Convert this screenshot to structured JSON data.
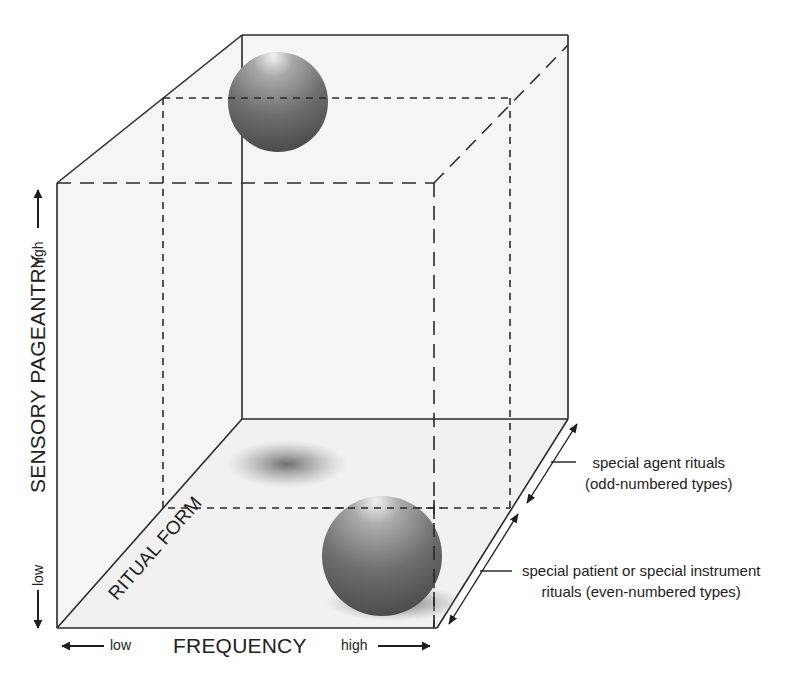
{
  "diagram": {
    "type": "3d-cube-diagram",
    "axes": {
      "vertical": {
        "title": "SENSORY PAGEANTRY",
        "low": "low",
        "high": "high"
      },
      "horizontal": {
        "title": "FREQUENCY",
        "low": "low",
        "high": "high"
      },
      "depth": {
        "title": "RITUAL FORM"
      }
    },
    "annotations": {
      "odd": {
        "line1": "special agent rituals",
        "line2": "(odd-numbered types)"
      },
      "even": {
        "line1": "special patient or special instrument",
        "line2": "rituals (even-numbered types)"
      }
    },
    "objects": [
      {
        "name": "high-pageantry-sphere",
        "region": "top-back"
      },
      {
        "name": "low-pageantry-sphere",
        "region": "bottom-front-right"
      },
      {
        "name": "floor-shadow",
        "region": "floor-back"
      }
    ],
    "colors": {
      "line": "#2a2a2a",
      "sphere_dark": "#4a4a4a",
      "sphere_light": "#e6e6e6",
      "panel_fill": "#f4f4f4"
    }
  }
}
